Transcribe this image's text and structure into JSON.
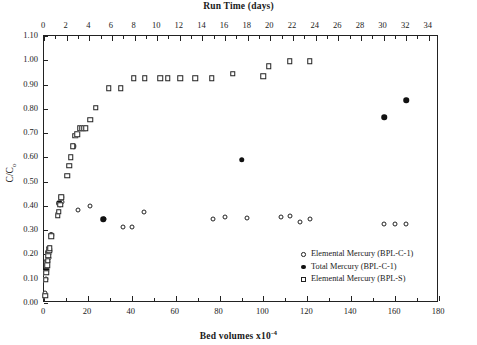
{
  "chart_data": {
    "type": "scatter",
    "title": "Run Time (days)",
    "xlabel": "Bed volumes x10-4",
    "xlabel_base": "Bed volumes x10",
    "xlabel_exp": "-4",
    "ylabel": "C/C",
    "ylabel_sub": "o",
    "top_axis_label": "Run Time (days)",
    "grid": false,
    "legend_position": "bottom-right",
    "xlim": [
      0,
      180
    ],
    "ylim": [
      0,
      1.1
    ],
    "x_ticks": [
      0,
      20,
      40,
      60,
      80,
      100,
      120,
      140,
      160,
      180
    ],
    "x_minor_step": 10,
    "y_ticks": [
      "0.00",
      "0.10",
      "0.20",
      "0.30",
      "0.40",
      "0.50",
      "0.60",
      "0.70",
      "0.80",
      "0.90",
      "1.00",
      "1.10"
    ],
    "top_xlim": [
      0,
      34.9
    ],
    "top_ticks": [
      0,
      2,
      4,
      6,
      8,
      10,
      12,
      14,
      16,
      18,
      20,
      22,
      24,
      26,
      28,
      30,
      32,
      34
    ],
    "top_minor_step": 1,
    "series": [
      {
        "name": "Elemental Mercury (BPL-C-1)",
        "symbol": "circ-open",
        "points": [
          [
            0.6,
            0.04
          ],
          [
            0.9,
            0.1
          ],
          [
            1.2,
            0.14
          ],
          [
            1.5,
            0.155
          ],
          [
            1.8,
            0.17
          ],
          [
            2.1,
            0.185
          ],
          [
            2.4,
            0.2
          ],
          [
            2.8,
            0.215
          ],
          [
            3.4,
            0.28
          ],
          [
            6.5,
            0.37
          ],
          [
            7.5,
            0.405
          ],
          [
            8.2,
            0.415
          ],
          [
            15.5,
            0.385
          ],
          [
            21.0,
            0.4
          ],
          [
            27.5,
            0.345
          ],
          [
            36.0,
            0.315
          ],
          [
            40.0,
            0.315
          ],
          [
            45.5,
            0.375
          ],
          [
            77.0,
            0.345
          ],
          [
            82.5,
            0.355
          ],
          [
            92.5,
            0.35
          ],
          [
            108.0,
            0.355
          ],
          [
            112.0,
            0.36
          ],
          [
            116.5,
            0.335
          ],
          [
            121.0,
            0.345
          ],
          [
            155.0,
            0.325
          ],
          [
            160.0,
            0.325
          ],
          [
            165.0,
            0.325
          ]
        ]
      },
      {
        "name": "Total Mercury (BPL-C-1)",
        "symbol": "circ-fill",
        "points": [
          [
            1.0,
            0.135
          ],
          [
            1.4,
            0.175
          ],
          [
            1.7,
            0.21
          ],
          [
            2.2,
            0.225
          ],
          [
            3.3,
            0.28
          ],
          [
            7.0,
            0.41
          ],
          [
            7.8,
            0.435
          ],
          [
            13.5,
            0.645
          ],
          [
            27.0,
            0.345
          ],
          [
            90.0,
            0.59
          ],
          [
            155.0,
            0.765
          ],
          [
            165.0,
            0.835
          ]
        ]
      },
      {
        "name": "Elemental Mercury (BPL-S)",
        "symbol": "sq-open",
        "points": [
          [
            0.5,
            0.03
          ],
          [
            0.8,
            0.095
          ],
          [
            1.1,
            0.125
          ],
          [
            1.4,
            0.155
          ],
          [
            1.7,
            0.175
          ],
          [
            2.0,
            0.195
          ],
          [
            2.3,
            0.215
          ],
          [
            2.6,
            0.225
          ],
          [
            3.2,
            0.275
          ],
          [
            6.2,
            0.36
          ],
          [
            6.8,
            0.375
          ],
          [
            7.3,
            0.405
          ],
          [
            7.9,
            0.435
          ],
          [
            10.5,
            0.525
          ],
          [
            11.5,
            0.565
          ],
          [
            12.2,
            0.6
          ],
          [
            13.2,
            0.645
          ],
          [
            14.2,
            0.69
          ],
          [
            15.2,
            0.695
          ],
          [
            16.2,
            0.72
          ],
          [
            17.3,
            0.72
          ],
          [
            18.2,
            0.72
          ],
          [
            19.0,
            0.72
          ],
          [
            21.0,
            0.755
          ],
          [
            23.5,
            0.805
          ],
          [
            29.5,
            0.885
          ],
          [
            35.0,
            0.885
          ],
          [
            41.0,
            0.925
          ],
          [
            46.0,
            0.925
          ],
          [
            53.0,
            0.925
          ],
          [
            56.5,
            0.925
          ],
          [
            62.0,
            0.925
          ],
          [
            69.0,
            0.925
          ],
          [
            76.5,
            0.925
          ],
          [
            86.0,
            0.945
          ],
          [
            100.0,
            0.935
          ],
          [
            102.5,
            0.975
          ],
          [
            112.0,
            0.995
          ],
          [
            121.0,
            0.995
          ]
        ]
      }
    ]
  },
  "legend": {
    "entries": [
      {
        "label": "Elemental Mercury (BPL-C-1)",
        "symbol": "circ-open"
      },
      {
        "label": "Total Mercury (BPL-C-1)",
        "symbol": "circ-fill"
      },
      {
        "label": "Elemental Mercury (BPL-S)",
        "symbol": "sq-open"
      }
    ]
  }
}
